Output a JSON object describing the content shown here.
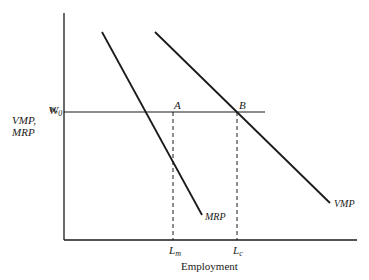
{
  "diagram": {
    "y_axis_label": [
      "w,",
      "VMP,",
      "MRP"
    ],
    "x_axis_label": "Employment",
    "wage_label": "W",
    "wage_sub": "0",
    "point_a": "A",
    "point_b": "B",
    "curve_mrp": "MRP",
    "curve_vmp": "VMP",
    "tick_lm": "L",
    "tick_lm_sub": "m",
    "tick_lc": "L",
    "tick_lc_sub": "c"
  }
}
